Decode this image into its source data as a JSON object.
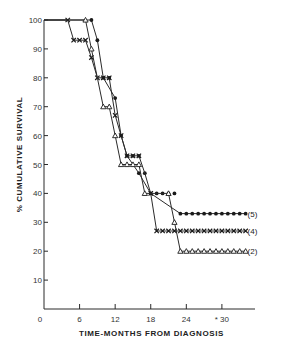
{
  "chart_data": {
    "type": "line",
    "subtype": "kaplan-meier-step",
    "title": "",
    "xlabel": "TIME-MONTHS FROM DIAGNOSIS",
    "ylabel": "% CUMULATIVE SURVIVAL",
    "xlim": [
      0,
      35
    ],
    "ylim": [
      0,
      100
    ],
    "x_ticks": [
      0,
      6,
      12,
      18,
      24,
      30
    ],
    "x_tick_labels": [
      "0",
      "6",
      "12",
      "18",
      "24",
      "* 30"
    ],
    "y_ticks": [
      10,
      20,
      30,
      40,
      50,
      60,
      70,
      80,
      90,
      100
    ],
    "y_tick_labels": [
      "10",
      "20",
      "30",
      "40",
      "50",
      "60",
      "70",
      "80",
      "90",
      "100"
    ],
    "origin_label": "0",
    "grid": false,
    "legend_position": "right end of each curve",
    "series": [
      {
        "name": "(5)",
        "marker": "filled-circle",
        "points": [
          [
            8,
            100
          ],
          [
            9,
            93
          ],
          [
            10,
            80
          ],
          [
            11,
            80
          ],
          [
            12,
            73
          ],
          [
            13,
            60
          ],
          [
            14,
            53
          ],
          [
            15,
            53
          ],
          [
            16,
            53
          ],
          [
            16,
            47
          ],
          [
            17,
            47
          ],
          [
            18,
            40
          ],
          [
            19,
            40
          ],
          [
            20,
            40
          ],
          [
            21,
            40
          ],
          [
            22,
            40
          ],
          [
            23,
            33
          ],
          [
            24,
            33
          ],
          [
            25,
            33
          ],
          [
            26,
            33
          ],
          [
            27,
            33
          ],
          [
            28,
            33
          ],
          [
            29,
            33
          ],
          [
            30,
            33
          ],
          [
            31,
            33
          ],
          [
            32,
            33
          ],
          [
            33,
            33
          ],
          [
            34,
            33
          ]
        ],
        "steps": [
          [
            0,
            100
          ],
          [
            8,
            100
          ],
          [
            9,
            93
          ],
          [
            10,
            80
          ],
          [
            12,
            73
          ],
          [
            13,
            60
          ],
          [
            14,
            53
          ],
          [
            16,
            47
          ],
          [
            18,
            40
          ],
          [
            23,
            33
          ],
          [
            34,
            33
          ]
        ]
      },
      {
        "name": "(4)",
        "marker": "x",
        "points": [
          [
            4,
            100
          ],
          [
            5,
            93
          ],
          [
            6,
            93
          ],
          [
            7,
            93
          ],
          [
            8,
            87
          ],
          [
            9,
            80
          ],
          [
            10,
            80
          ],
          [
            11,
            80
          ],
          [
            12,
            67
          ],
          [
            13,
            60
          ],
          [
            14,
            53
          ],
          [
            15,
            53
          ],
          [
            16,
            53
          ],
          [
            18,
            40
          ],
          [
            19,
            27
          ],
          [
            20,
            27
          ],
          [
            21,
            27
          ],
          [
            22,
            27
          ],
          [
            23,
            27
          ],
          [
            24,
            27
          ],
          [
            25,
            27
          ],
          [
            26,
            27
          ],
          [
            27,
            27
          ],
          [
            28,
            27
          ],
          [
            29,
            27
          ],
          [
            30,
            27
          ],
          [
            31,
            27
          ],
          [
            32,
            27
          ],
          [
            33,
            27
          ],
          [
            34,
            27
          ]
        ],
        "steps": [
          [
            0,
            100
          ],
          [
            4,
            100
          ],
          [
            5,
            93
          ],
          [
            7,
            93
          ],
          [
            8,
            87
          ],
          [
            9,
            80
          ],
          [
            11,
            80
          ],
          [
            12,
            67
          ],
          [
            13,
            60
          ],
          [
            14,
            53
          ],
          [
            16,
            53
          ],
          [
            17,
            47
          ],
          [
            18,
            40
          ],
          [
            19,
            27
          ],
          [
            34,
            27
          ]
        ]
      },
      {
        "name": "(2)",
        "marker": "open-triangle",
        "points": [
          [
            7,
            100
          ],
          [
            8,
            90
          ],
          [
            10,
            70
          ],
          [
            11,
            70
          ],
          [
            12,
            60
          ],
          [
            13,
            50
          ],
          [
            14,
            50
          ],
          [
            15,
            50
          ],
          [
            16,
            50
          ],
          [
            17,
            40
          ],
          [
            21,
            40
          ],
          [
            22,
            30
          ],
          [
            23,
            20
          ],
          [
            24,
            20
          ],
          [
            25,
            20
          ],
          [
            26,
            20
          ],
          [
            27,
            20
          ],
          [
            28,
            20
          ],
          [
            29,
            20
          ],
          [
            30,
            20
          ],
          [
            31,
            20
          ],
          [
            32,
            20
          ],
          [
            33,
            20
          ],
          [
            34,
            20
          ]
        ],
        "steps": [
          [
            0,
            100
          ],
          [
            7,
            100
          ],
          [
            8,
            90
          ],
          [
            10,
            70
          ],
          [
            11,
            70
          ],
          [
            12,
            60
          ],
          [
            13,
            50
          ],
          [
            16,
            50
          ],
          [
            17,
            40
          ],
          [
            21,
            40
          ],
          [
            22,
            30
          ],
          [
            23,
            20
          ],
          [
            34,
            20
          ]
        ]
      }
    ]
  }
}
